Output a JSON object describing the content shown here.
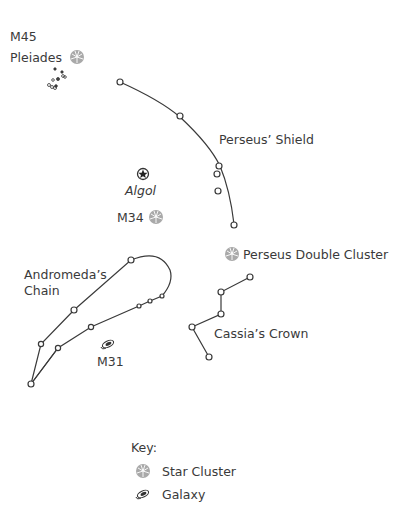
{
  "labels": {
    "m45": "M45",
    "pleiades": "Pleiades",
    "perseus_shield": "Perseus’ Shield",
    "algol": "Algol",
    "m34": "M34",
    "double_cluster": "Perseus Double Cluster",
    "andromeda_line1": "Andromeda’s",
    "andromeda_line2": "Chain",
    "m31": "M31",
    "cassia_crown": "Cassia’s Crown"
  },
  "key": {
    "title": "Key:",
    "items": [
      {
        "icon": "star-cluster-icon",
        "label": "Star Cluster"
      },
      {
        "icon": "galaxy-icon",
        "label": "Galaxy"
      }
    ]
  },
  "colors": {
    "line": "#3a3a3a",
    "cluster_fill": "#a8a8a8",
    "text": "#3a3a3a"
  }
}
